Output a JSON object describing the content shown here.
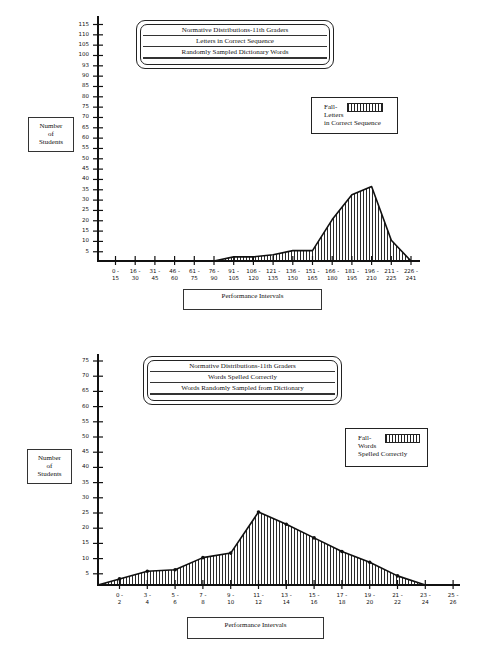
{
  "chart_data": [
    {
      "type": "area",
      "title": "Normative Distributions-11th Graders",
      "subtitle": [
        "Letters in Correct Sequence",
        "Randomly Sampled Dictionary Words"
      ],
      "xlabel": "Performance Intervals",
      "ylabel": "Number of Students",
      "ylim": [
        0,
        115
      ],
      "yticks": [
        5,
        10,
        15,
        20,
        25,
        30,
        35,
        40,
        45,
        50,
        55,
        60,
        65,
        70,
        75,
        80,
        85,
        93,
        90,
        100,
        105,
        110,
        115
      ],
      "ytick_labels": [
        "5",
        "10",
        "15",
        "20",
        "25",
        "30",
        "35",
        "40",
        "45",
        "50",
        "55",
        "60",
        "65",
        "70",
        "75",
        "80",
        "85",
        "90",
        "93",
        "100",
        "105",
        "110",
        "115"
      ],
      "categories": [
        "0-15",
        "16-30",
        "31-45",
        "46-60",
        "61-75",
        "76-90",
        "91-105",
        "106-120",
        "121-135",
        "136-150",
        "151-165",
        "166-180",
        "181-195",
        "196-210",
        "211-225",
        "226-241"
      ],
      "series": [
        {
          "name": "Fall-Letters in Correct Sequence",
          "values": [
            0,
            0,
            0,
            0,
            0,
            0,
            2,
            2,
            3,
            5,
            5,
            20,
            32,
            36,
            10,
            0
          ]
        }
      ],
      "legend": {
        "label_lines": [
          "Fall-",
          "Letters",
          "in Correct Sequence"
        ],
        "position": "upper right",
        "fill": "vertical hatch"
      },
      "grid": false
    },
    {
      "type": "area",
      "title": "Normative Distributions-11th Graders",
      "subtitle": [
        "Words Spelled Correctly",
        "Words Randomly Sampled from Dictionary"
      ],
      "xlabel": "Performance Intervals",
      "ylabel": "Number of Students",
      "ylim": [
        0,
        75
      ],
      "ytick_labels": [
        "5",
        "10",
        "15",
        "20",
        "25",
        "30",
        "35",
        "40",
        "45",
        "50",
        "55",
        "60",
        "65",
        "70",
        "75"
      ],
      "categories": [
        "0-2",
        "3-4",
        "5-6",
        "7-8",
        "9-10",
        "11-12",
        "13-14",
        "15-16",
        "17-18",
        "19-20",
        "21-22",
        "23-24",
        "25-26"
      ],
      "series": [
        {
          "name": "Fall-Words Spelled Correctly",
          "values": [
            2,
            4.5,
            5,
            9,
            10.5,
            24,
            20,
            15.5,
            11,
            7.5,
            3,
            0,
            null
          ]
        }
      ],
      "legend": {
        "label_lines": [
          "Fall-",
          "Words",
          "Spelled Correctly"
        ],
        "position": "upper right",
        "fill": "vertical hatch",
        "markers": "filled circles"
      },
      "grid": false
    }
  ],
  "top": {
    "title_lines": [
      "Normative Distributions-11th Graders",
      "Letters in Correct Sequence",
      "Randomly Sampled Dictionary Words"
    ],
    "ylabel_lines": [
      "Number",
      "of",
      "Students"
    ],
    "legend_lines": [
      "Fall-",
      "Letters",
      "in Correct Sequence"
    ],
    "xlabel": "Performance Intervals",
    "yticks": [
      "115",
      "110",
      "105",
      "100",
      "93",
      "90",
      "85",
      "80",
      "75",
      "70",
      "65",
      "60",
      "55",
      "50",
      "45",
      "40",
      "35",
      "30",
      "25",
      "20",
      "15",
      "10",
      "5"
    ],
    "xticks": [
      [
        "0 -",
        "15"
      ],
      [
        "16 -",
        "30"
      ],
      [
        "31 -",
        "45"
      ],
      [
        "46 -",
        "60"
      ],
      [
        "61 -",
        "75"
      ],
      [
        "76 -",
        "90"
      ],
      [
        "91 -",
        "105"
      ],
      [
        "106 -",
        "120"
      ],
      [
        "121 -",
        "135"
      ],
      [
        "136 -",
        "150"
      ],
      [
        "151 -",
        "165"
      ],
      [
        "166 -",
        "180"
      ],
      [
        "181 -",
        "195"
      ],
      [
        "196 -",
        "210"
      ],
      [
        "211 -",
        "225"
      ],
      [
        "226 -",
        "241"
      ]
    ]
  },
  "bottom": {
    "title_lines": [
      "Normative Distributions-11th Graders",
      "Words Spelled Correctly",
      "Words Randomly Sampled from Dictionary"
    ],
    "ylabel_lines": [
      "Number",
      "of",
      "Students"
    ],
    "legend_lines": [
      "Fall-",
      "Words",
      "Spelled Correctly"
    ],
    "xlabel": "Performance Intervals",
    "yticks": [
      "75",
      "70",
      "65",
      "60",
      "55",
      "50",
      "45",
      "40",
      "35",
      "30",
      "25",
      "20",
      "15",
      "10",
      "5"
    ],
    "xticks": [
      [
        "0 -",
        "2"
      ],
      [
        "3 -",
        "4"
      ],
      [
        "5 -",
        "6"
      ],
      [
        "7 -",
        "8"
      ],
      [
        "9 -",
        "10"
      ],
      [
        "11 -",
        "12"
      ],
      [
        "13 -",
        "14"
      ],
      [
        "15 -",
        "16"
      ],
      [
        "17 -",
        "18"
      ],
      [
        "19 -",
        "20"
      ],
      [
        "21 -",
        "22"
      ],
      [
        "23 -",
        "24"
      ],
      [
        "25 -",
        "26"
      ]
    ]
  },
  "colors": {
    "ink": "#111111",
    "paper": "#ffffff"
  }
}
